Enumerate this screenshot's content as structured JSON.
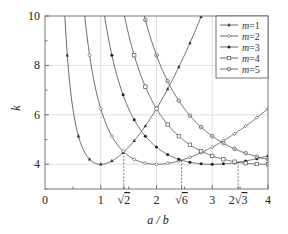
{
  "chart_data": {
    "type": "line",
    "title": "",
    "xlabel": "a / b",
    "ylabel": "k",
    "xlim": [
      0,
      4
    ],
    "ylim": [
      3,
      10
    ],
    "grid": true,
    "legend_position": "upper right",
    "x_ticks": [
      {
        "value": 0,
        "label": "0"
      },
      {
        "value": 1,
        "label": "1"
      },
      {
        "value": 1.41421,
        "label": "√2"
      },
      {
        "value": 2,
        "label": "2"
      },
      {
        "value": 2.44949,
        "label": "√6"
      },
      {
        "value": 3,
        "label": "3"
      },
      {
        "value": 3.4641,
        "label": "2√3"
      },
      {
        "value": 4,
        "label": "4"
      }
    ],
    "y_ticks": [
      {
        "value": 4,
        "label": "4"
      },
      {
        "value": 6,
        "label": "6"
      },
      {
        "value": 8,
        "label": "8"
      },
      {
        "value": 10,
        "label": "10"
      }
    ],
    "annotations": [
      {
        "type": "dashed-drop-line",
        "x": 1.41421,
        "y": 4.5
      },
      {
        "type": "dashed-drop-line",
        "x": 2.44949,
        "y": 4.1667
      },
      {
        "type": "dashed-drop-line",
        "x": 3.4641,
        "y": 4.0833
      }
    ],
    "formula": "k = (m·b/a + a/(m·b))²",
    "series": [
      {
        "name": "m=1",
        "m": 1,
        "marker": "triangle-filled",
        "x": [
          0.5,
          0.6,
          0.8,
          1.0,
          1.2,
          1.4,
          1.6,
          1.8,
          2.0,
          2.2,
          2.4,
          2.6,
          2.8
        ],
        "values": [
          6.25,
          5.14,
          4.2,
          4.0,
          4.11,
          4.47,
          5.02,
          5.72,
          6.25,
          7.3,
          8.3,
          9.4,
          10.4
        ]
      },
      {
        "name": "m=2",
        "m": 2,
        "marker": "diamond-hollow",
        "x": [
          1.0,
          1.2,
          1.5,
          2.0,
          2.5,
          3.0,
          3.5,
          4.0
        ],
        "values": [
          6.25,
          5.14,
          4.34,
          4.0,
          4.1,
          4.69,
          5.35,
          6.25
        ]
      },
      {
        "name": "m=3",
        "m": 3,
        "marker": "circle-filled",
        "x": [
          1.5,
          2.0,
          2.5,
          3.0,
          3.5,
          4.0
        ],
        "values": [
          6.25,
          4.69,
          4.12,
          4.0,
          4.02,
          4.34
        ]
      },
      {
        "name": "m=4",
        "m": 4,
        "marker": "square-hollow",
        "x": [
          2.0,
          2.5,
          3.0,
          3.5,
          4.0
        ],
        "values": [
          6.25,
          4.94,
          4.34,
          4.08,
          4.0
        ]
      },
      {
        "name": "m=5",
        "m": 5,
        "marker": "circle-dot",
        "x": [
          2.5,
          3.0,
          3.5,
          4.0
        ],
        "values": [
          6.25,
          5.21,
          4.55,
          4.2
        ]
      }
    ]
  },
  "legend": {
    "entries": [
      "m=1",
      "m=2",
      "m=3",
      "m=4",
      "m=5"
    ]
  }
}
